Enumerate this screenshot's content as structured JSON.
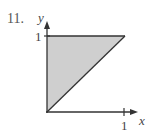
{
  "problem_number": "11.",
  "axes": {
    "x_label": "x",
    "y_label": "y",
    "x_tick_label": "1",
    "y_tick_label": "1"
  },
  "region": {
    "shape": "triangle",
    "vertices": [
      [
        0,
        0
      ],
      [
        0,
        1
      ],
      [
        1,
        1
      ]
    ],
    "description": "Shaded region bounded by x = 0, y = 1, and y = x",
    "fill_color": "#cfcfcf",
    "stroke_color": "#333333"
  }
}
